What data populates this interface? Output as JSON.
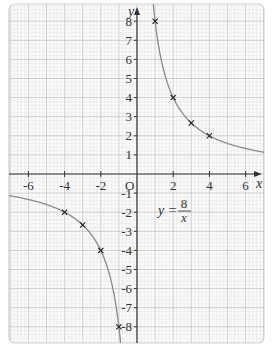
{
  "chart_data": {
    "type": "line",
    "title": "",
    "equation": {
      "lhs": "y =",
      "numerator": "8",
      "denominator": "x"
    },
    "xlabel": "x",
    "ylabel": "y",
    "origin_label": "O",
    "xlim": [
      -7,
      7
    ],
    "ylim": [
      -8.8,
      8.5
    ],
    "grid": true,
    "x_ticks": [
      -6,
      -4,
      -2,
      2,
      4,
      6
    ],
    "x_tick_labels": [
      "-6",
      "-4",
      "-2",
      "2",
      "4",
      "6"
    ],
    "y_ticks": [
      8,
      7,
      6,
      5,
      4,
      3,
      2,
      1,
      -1,
      -2,
      -3,
      -4,
      -5,
      -6,
      -7,
      -8
    ],
    "y_tick_labels": [
      "8",
      "7",
      "6",
      "5",
      "4",
      "3",
      "2",
      "1",
      "-1",
      "-2",
      "-3",
      "-4",
      "-5",
      "-6",
      "-7",
      "-8"
    ],
    "series": [
      {
        "name": "y = 8/x",
        "function": "8/x",
        "style": "curve",
        "color": "#8a8a8a"
      }
    ],
    "points": [
      {
        "x": 1,
        "y": 8
      },
      {
        "x": 2,
        "y": 4
      },
      {
        "x": 3,
        "y": 2.67
      },
      {
        "x": 4,
        "y": 2
      },
      {
        "x": -1,
        "y": -8
      },
      {
        "x": -2,
        "y": -4
      },
      {
        "x": -3,
        "y": -2.67
      },
      {
        "x": -4,
        "y": -2
      }
    ],
    "marker": "x",
    "colors": {
      "grid_minor": "#e2e2e2",
      "grid_major": "#c4c4c4",
      "axis": "#333333",
      "curve": "#8a8a8a",
      "frame": "#d0d0d0"
    }
  }
}
